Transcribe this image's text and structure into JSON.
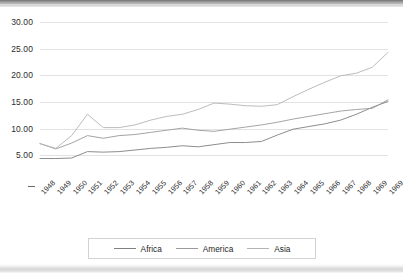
{
  "figure": {
    "type": "scanned-chart-figure",
    "background": "#ffffff"
  },
  "chart_data": {
    "type": "line",
    "title": "",
    "subtitle": "",
    "xlabel": "",
    "ylabel": "",
    "ylim": [
      0,
      30
    ],
    "yticks": [
      "5.00",
      "10.00",
      "15.00",
      "20.00",
      "25.00",
      "30.00"
    ],
    "ytick_values": [
      5,
      10,
      15,
      20,
      25,
      30
    ],
    "grid": true,
    "legend_position": "bottom",
    "categories": [
      "1948",
      "1949",
      "1950",
      "1951",
      "1952",
      "1953",
      "1954",
      "1955",
      "1956",
      "1957",
      "1958",
      "1959",
      "1960",
      "1961",
      "1962",
      "1963",
      "1964",
      "1965",
      "1966",
      "1967",
      "1968",
      "1969",
      "1969"
    ],
    "series": [
      {
        "name": "Africa",
        "color": "#808080",
        "values": [
          4.4,
          4.4,
          4.5,
          5.7,
          5.6,
          5.7,
          6.0,
          6.3,
          6.5,
          6.8,
          6.6,
          7.0,
          7.4,
          7.4,
          7.6,
          8.8,
          9.9,
          10.4,
          10.9,
          11.6,
          12.7,
          14.0,
          15.1
        ]
      },
      {
        "name": "America",
        "color": "#9a9a9a",
        "values": [
          7.2,
          6.2,
          7.3,
          8.7,
          8.2,
          8.7,
          8.9,
          9.3,
          9.7,
          10.1,
          9.7,
          9.5,
          9.9,
          10.3,
          10.7,
          11.2,
          11.8,
          12.3,
          12.8,
          13.3,
          13.6,
          13.8,
          15.4
        ]
      },
      {
        "name": "Asia",
        "color": "#b4b4b4",
        "values": [
          7.2,
          6.3,
          8.7,
          12.7,
          10.2,
          10.2,
          10.7,
          11.6,
          12.3,
          12.7,
          13.6,
          14.8,
          14.6,
          14.3,
          14.2,
          14.5,
          16.0,
          17.4,
          18.7,
          19.9,
          20.4,
          21.5,
          24.3
        ]
      }
    ]
  },
  "legend": {
    "items": [
      {
        "label": "Africa",
        "color": "#808080"
      },
      {
        "label": "America",
        "color": "#9a9a9a"
      },
      {
        "label": "Asia",
        "color": "#b4b4b4"
      }
    ]
  }
}
